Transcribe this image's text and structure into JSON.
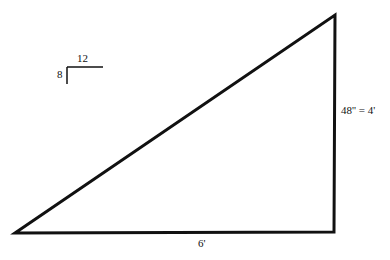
{
  "diagram": {
    "type": "right-triangle",
    "vertices": {
      "left": [
        15,
        233
      ],
      "bottom_right": [
        334,
        232
      ],
      "top_right": [
        335,
        15
      ]
    },
    "stroke_color": "#111111",
    "labels": {
      "base": "6'",
      "height": "48'' = 4'",
      "pitch_run": "12",
      "pitch_rise": "8"
    },
    "pitch_symbol": {
      "run": "12",
      "rise": "8"
    }
  }
}
